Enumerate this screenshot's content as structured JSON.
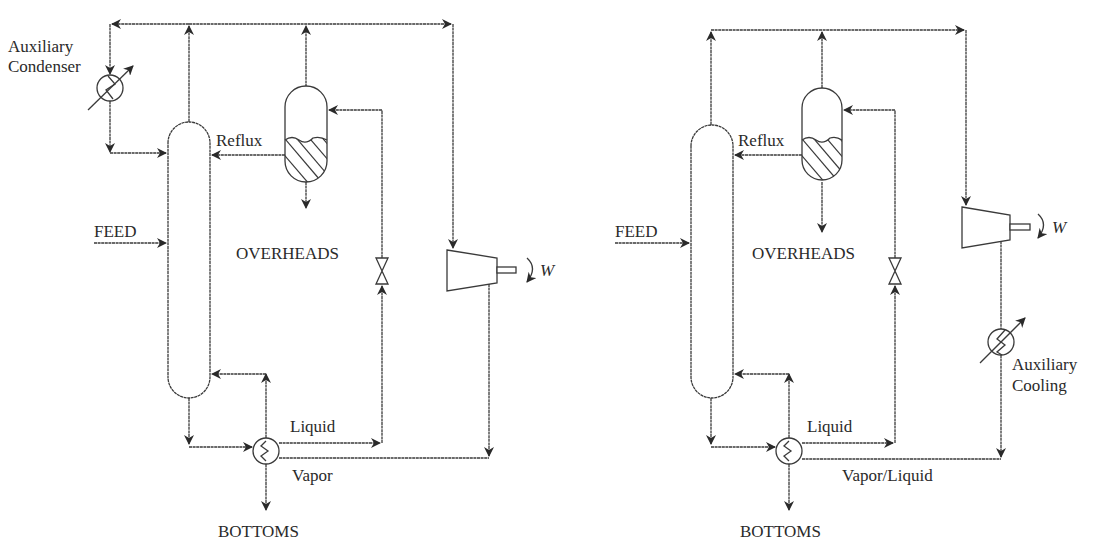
{
  "figure": {
    "left_diagram": {
      "labels": {
        "aux_condenser_line1": "Auxiliary",
        "aux_condenser_line2": "Condenser",
        "reflux": "Reflux",
        "feed": "FEED",
        "overheads": "OVERHEADS",
        "work": "W",
        "liquid": "Liquid",
        "vapor": "Vapor",
        "bottoms": "BOTTOMS"
      },
      "equipment": [
        "distillation-column",
        "reflux-drum",
        "auxiliary-condenser",
        "throttle-valve",
        "compressor",
        "reboiler"
      ]
    },
    "right_diagram": {
      "labels": {
        "reflux": "Reflux",
        "feed": "FEED",
        "overheads": "OVERHEADS",
        "work": "W",
        "aux_cooling_line1": "Auxiliary",
        "aux_cooling_line2": "Cooling",
        "liquid": "Liquid",
        "vapor_liquid": "Vapor/Liquid",
        "bottoms": "BOTTOMS"
      },
      "equipment": [
        "distillation-column",
        "reflux-drum",
        "throttle-valve",
        "compressor",
        "auxiliary-cooler",
        "reboiler"
      ]
    },
    "colors": {
      "line": "#3a3a3a",
      "text": "#2a2a2a",
      "background": "#ffffff"
    }
  }
}
